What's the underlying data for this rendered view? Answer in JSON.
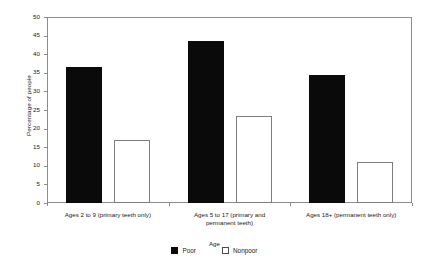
{
  "chart_data": {
    "type": "bar",
    "title": "",
    "xlabel": "Age",
    "ylabel": "Percentage of people",
    "ylim": [
      0,
      50
    ],
    "yticks": [
      0,
      5,
      10,
      15,
      20,
      25,
      30,
      35,
      40,
      45,
      50
    ],
    "grid": false,
    "legend_position": "bottom-center",
    "categories": [
      "Ages 2 to 9 (primary teeth only)",
      "Ages 5 to 17 (primary and permanent teeth)",
      "Ages 18+ (permanent teeth only)"
    ],
    "category_lines": [
      [
        "Ages 2 to 9 (primary teeth only)"
      ],
      [
        "Ages 5 to 17 (primary and",
        "permanent teeth)"
      ],
      [
        "Ages 18+ (permanent teeth only)"
      ]
    ],
    "series": [
      {
        "name": "Poor",
        "color": "#0a0a0a",
        "values": [
          36.5,
          43.5,
          34.5
        ]
      },
      {
        "name": "Nonpoor",
        "color": "#ffffff",
        "values": [
          17.0,
          23.5,
          11.0
        ]
      }
    ]
  },
  "axis": {
    "y_title": "Percentage of people",
    "x_title": "Age",
    "y_labels": [
      "50",
      "45",
      "40",
      "35",
      "30",
      "25",
      "20",
      "15",
      "10",
      "5",
      "0"
    ]
  },
  "legend": {
    "entries": [
      {
        "label": "Poor",
        "swatch": "filled-square-icon"
      },
      {
        "label": "Nonpoor",
        "swatch": "open-square-icon"
      }
    ]
  }
}
